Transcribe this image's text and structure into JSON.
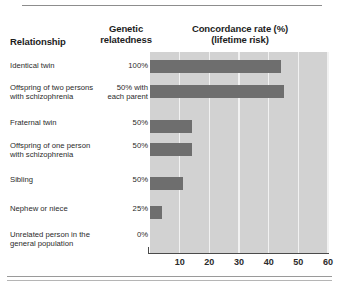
{
  "chart_data": {
    "type": "bar",
    "orientation": "horizontal",
    "title": "Concordance rate (%) (lifetime risk)",
    "xlabel": "",
    "ylabel": "",
    "xlim": [
      0,
      60
    ],
    "xticks": [
      10,
      20,
      30,
      40,
      50,
      60
    ],
    "grid": true,
    "legend": "none",
    "categories": [
      "Identical twin",
      "Offspring of two persons with schizophrenia",
      "Fraternal twin",
      "Offspring of one person with schizophrenia",
      "Sibling",
      "Nephew or niece",
      "Unrelated person in the general population"
    ],
    "values": [
      44,
      45,
      14,
      14,
      11,
      4,
      0
    ],
    "series": [
      {
        "name": "Concordance rate (%)",
        "values": [
          44,
          45,
          14,
          14,
          11,
          4,
          0
        ]
      }
    ],
    "bar_color": "#6e6e6e",
    "plot_background": "#d2d2d2"
  },
  "headers": {
    "relationship": "Relationship",
    "genetic_line1": "Genetic",
    "genetic_line2": "relatedness",
    "concordance_line1": "Concordance rate (%)",
    "concordance_line2": "(lifetime risk)"
  },
  "rows": [
    {
      "relationship_line1": "Identical twin",
      "relationship_line2": "",
      "genetic_line1": "100%",
      "genetic_line2": "",
      "value": 44
    },
    {
      "relationship_line1": "Offspring of two persons",
      "relationship_line2": "with schizophrenia",
      "genetic_line1": "50% with",
      "genetic_line2": "each parent",
      "value": 45
    },
    {
      "relationship_line1": "Fraternal twin",
      "relationship_line2": "",
      "genetic_line1": "50%",
      "genetic_line2": "",
      "value": 14
    },
    {
      "relationship_line1": "Offspring of one person",
      "relationship_line2": "with schizophrenia",
      "genetic_line1": "50%",
      "genetic_line2": "",
      "value": 14
    },
    {
      "relationship_line1": "Sibling",
      "relationship_line2": "",
      "genetic_line1": "50%",
      "genetic_line2": "",
      "value": 11
    },
    {
      "relationship_line1": "Nephew or niece",
      "relationship_line2": "",
      "genetic_line1": "25%",
      "genetic_line2": "",
      "value": 4
    },
    {
      "relationship_line1": "Unrelated person in the",
      "relationship_line2": "general population",
      "genetic_line1": "0%",
      "genetic_line2": "",
      "value": 0
    }
  ],
  "ticks": [
    "10",
    "20",
    "30",
    "40",
    "50",
    "60"
  ]
}
